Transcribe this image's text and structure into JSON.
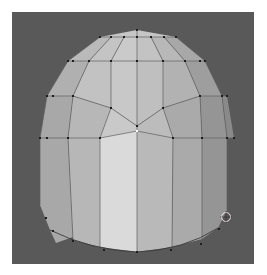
{
  "viewport": {
    "name": "3d-viewport",
    "background": "#595959",
    "object": "dome-mesh",
    "mode": "edit-mode-vertex"
  },
  "mesh": {
    "colors": {
      "face_light": "#d9d9d9",
      "face_mid": "#bdbdbd",
      "face_dark": "#a4a4a4",
      "face_shadow": "#8e8e8e",
      "edge": "#555555",
      "vertex": "#1e1e1e",
      "selected_vertex": "#ffffff"
    }
  },
  "cursor": {
    "icon": "3d-cursor-icon",
    "x": 226,
    "y": 217
  }
}
